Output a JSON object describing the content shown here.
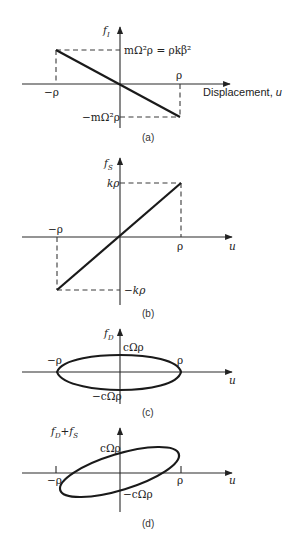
{
  "panels": [
    {
      "id": "a",
      "caption": "(a)",
      "y_axis_label": "f",
      "y_axis_sub": "I",
      "x_axis_label": "Displacement, u",
      "x_tick_neg": "−ρ",
      "x_tick_pos": "ρ",
      "y_top_label": "mΩ²ρ = ρkβ²",
      "y_bottom_label": "−mΩ²ρ",
      "relation": "f_I = −mΩ²u (line through origin, negative slope)"
    },
    {
      "id": "b",
      "caption": "(b)",
      "y_axis_label": "f",
      "y_axis_sub": "S",
      "x_axis_label": "u",
      "x_tick_neg": "−ρ",
      "x_tick_pos": "ρ",
      "y_top_label": "kρ",
      "y_bottom_label": "−kρ",
      "relation": "f_S = k u (line through origin, positive slope)"
    },
    {
      "id": "c",
      "caption": "(c)",
      "y_axis_label": "f",
      "y_axis_sub": "D",
      "x_axis_label": "u",
      "x_tick_neg": "−ρ",
      "x_tick_pos": "ρ",
      "y_top_label": "cΩρ",
      "y_bottom_label": "−cΩρ",
      "relation": "ellipse centered at origin"
    },
    {
      "id": "d",
      "caption": "(d)",
      "y_axis_label": "f_D + f_S",
      "x_axis_label": "u",
      "x_tick_neg": "−ρ",
      "x_tick_pos": "ρ",
      "y_top_label": "cΩρ",
      "y_bottom_label": "−cΩρ",
      "relation": "tilted ellipse (hysteresis loop)"
    }
  ],
  "labels": {
    "f": "f",
    "plus": "+",
    "D": "D",
    "S": "S",
    "I": "I",
    "u": "u",
    "displacement": "Displacement, "
  }
}
